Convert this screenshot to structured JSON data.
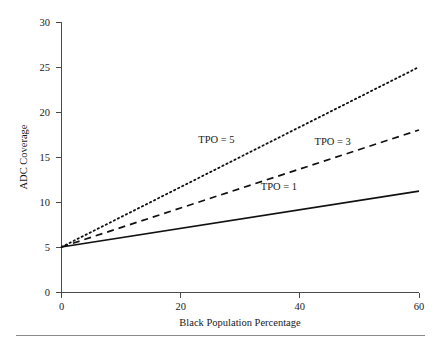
{
  "chart_data": {
    "type": "line",
    "title": "",
    "subtitle": "",
    "xlabel": "Black Population Percentage",
    "ylabel": "ADC Coverage",
    "xlim": [
      0,
      60
    ],
    "ylim": [
      0,
      30
    ],
    "xticks": [
      0,
      20,
      40,
      60
    ],
    "yticks": [
      0,
      5,
      10,
      15,
      20,
      25,
      30
    ],
    "xtick_labels": [
      "0",
      "20",
      "40",
      "60"
    ],
    "ytick_labels": [
      "0",
      "5",
      "10",
      "15",
      "20",
      "25",
      "30"
    ],
    "grid": false,
    "legend_position": "inline-annotations",
    "x": [
      0,
      60
    ],
    "series": [
      {
        "name": "TPO = 1",
        "style": "solid",
        "color": "#111111",
        "values": [
          5.0,
          11.2
        ],
        "annotation": {
          "text": "TPO = 1",
          "x": 36.5,
          "y": 11.3
        }
      },
      {
        "name": "TPO = 3",
        "style": "dashed",
        "color": "#111111",
        "values": [
          5.0,
          18.0
        ],
        "annotation": {
          "text": "TPO = 3",
          "x": 45.5,
          "y": 16.3
        }
      },
      {
        "name": "TPO = 5",
        "style": "dotted",
        "color": "#111111",
        "values": [
          5.0,
          25.0
        ],
        "annotation": {
          "text": "TPO = 5",
          "x": 26.0,
          "y": 16.6
        }
      }
    ]
  },
  "axes": {
    "y_axis_title": "ADC Coverage",
    "x_axis_title": "Black Population Percentage",
    "y_tick_0": "0",
    "y_tick_1": "5",
    "y_tick_2": "10",
    "y_tick_3": "15",
    "y_tick_4": "20",
    "y_tick_5": "25",
    "y_tick_6": "30",
    "x_tick_0": "0",
    "x_tick_1": "20",
    "x_tick_2": "40",
    "x_tick_3": "60"
  },
  "annotations": {
    "tpo5": "TPO = 5",
    "tpo3": "TPO = 3",
    "tpo1": "TPO = 1"
  },
  "colors": {
    "line": "#111111",
    "axis": "#4a4a4a",
    "rule": "#8a8a8a",
    "background": "#ffffff"
  }
}
